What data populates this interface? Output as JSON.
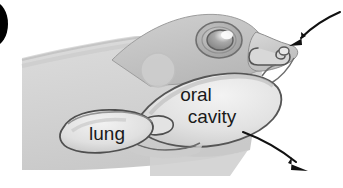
{
  "figure": {
    "name": "frog-respiration-diagram",
    "background_color": "#ffffff",
    "body_fill": "#d4d4d4",
    "outline_color": "#4a4a4a",
    "arrow_color": "#111111",
    "label_color": "#1a1a1a"
  },
  "marker": {
    "name": "figure-panel-marker",
    "shape": "filled-circle-cropped",
    "color": "#000000"
  },
  "labels": {
    "oral_cavity_line1": "oral",
    "oral_cavity_line2": "cavity",
    "lung": "lung"
  },
  "arrows": [
    {
      "name": "nostril-inflow-arrow",
      "direction": "down-left",
      "description": "air entering the external naris"
    },
    {
      "name": "throat-outflow-arrow",
      "direction": "down-right",
      "description": "air moving out past the lower jaw"
    }
  ],
  "anatomy": [
    {
      "name": "head-outline",
      "label": ""
    },
    {
      "name": "eye",
      "label": ""
    },
    {
      "name": "eye-pupil",
      "label": ""
    },
    {
      "name": "eye-highlight",
      "label": ""
    },
    {
      "name": "tympanum",
      "label": ""
    },
    {
      "name": "nostril-passage",
      "label": ""
    },
    {
      "name": "oral-cavity",
      "label": "oral cavity"
    },
    {
      "name": "glottis",
      "label": ""
    },
    {
      "name": "lung",
      "label": "lung"
    },
    {
      "name": "trunk-body",
      "label": ""
    }
  ]
}
